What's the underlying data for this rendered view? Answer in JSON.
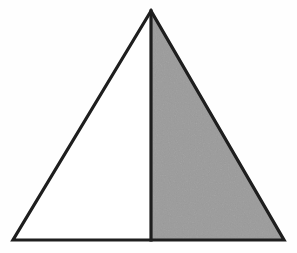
{
  "figure": {
    "canvas": {
      "width": 297,
      "height": 253,
      "background_color": "#fefefe"
    },
    "stroke": {
      "color": "#1e1e1e",
      "width": 3.2,
      "linejoin": "miter"
    },
    "shapes": {
      "triangle": {
        "name": "outer-triangle",
        "vertices": {
          "apex": {
            "label": "apex",
            "x": 151,
            "y": 11
          },
          "bottom_left": {
            "label": "bottom-left",
            "x": 13,
            "y": 240
          },
          "bottom_right": {
            "label": "bottom-right",
            "x": 284,
            "y": 240
          }
        },
        "points": "151,11 13,240 284,240",
        "fill_color": "#ffffff"
      },
      "shaded_region": {
        "name": "right-half-shaded",
        "points": "151,11 284,240 151,240",
        "fill_color": "#9b9b9b",
        "description": "right sub-triangle shaded gray"
      },
      "unshaded_region": {
        "name": "left-half-unshaded",
        "points": "151,11 13,240 151,240",
        "fill_color": "#ffffff",
        "description": "left sub-triangle left white"
      },
      "divider": {
        "name": "vertical-altitude",
        "x1": 151,
        "y1": 11,
        "x2": 151,
        "y2": 240,
        "color": "#1e1e1e",
        "width": 3.2
      }
    },
    "labels": [],
    "annotations": []
  }
}
